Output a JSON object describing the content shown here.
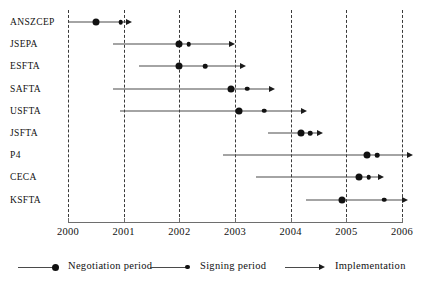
{
  "chart_data": {
    "type": "timeline",
    "title": "",
    "xlabel": "",
    "ylabel": "",
    "xlim": [
      2000,
      2006
    ],
    "xticks": [
      2000,
      2001,
      2002,
      2003,
      2004,
      2005,
      2006
    ],
    "xtick_labels": [
      "2000",
      "2001",
      "2002",
      "2003",
      "2004",
      "2005",
      "2006"
    ],
    "grid": "vertical dashed gridlines at each year tick",
    "legend_position": "below axis, horizontal",
    "categories": [
      "ANSZCEP",
      "JSEPA",
      "ESFTA",
      "SAFTA",
      "USFTA",
      "JSFTA",
      "P4",
      "CECA",
      "KSFTA"
    ],
    "series": [
      {
        "name": "ANSZCEP",
        "negotiation_start": 2000.0,
        "negotiation_end": 2000.5,
        "signing": 2000.95,
        "implementation_end": 2001.15
      },
      {
        "name": "JSEPA",
        "negotiation_start": 2000.8,
        "negotiation_end": 2002.0,
        "signing": 2002.17,
        "implementation_end": 2003.0
      },
      {
        "name": "ESFTA",
        "negotiation_start": 2001.27,
        "negotiation_end": 2002.0,
        "signing": 2002.47,
        "implementation_end": 2003.2
      },
      {
        "name": "SAFTA",
        "negotiation_start": 2000.8,
        "negotiation_end": 2002.93,
        "signing": 2003.22,
        "implementation_end": 2003.72
      },
      {
        "name": "USFTA",
        "negotiation_start": 2000.94,
        "negotiation_end": 2003.07,
        "signing": 2003.52,
        "implementation_end": 2004.3
      },
      {
        "name": "JSFTA",
        "negotiation_start": 2003.6,
        "negotiation_end": 2004.18,
        "signing": 2004.35,
        "implementation_end": 2004.58
      },
      {
        "name": "P4",
        "negotiation_start": 2002.78,
        "negotiation_end": 2005.38,
        "signing": 2005.55,
        "implementation_end": 2006.2
      },
      {
        "name": "CECA",
        "negotiation_start": 2003.38,
        "negotiation_end": 2005.23,
        "signing": 2005.4,
        "implementation_end": 2005.68
      },
      {
        "name": "KSFTA",
        "negotiation_start": 2004.28,
        "negotiation_end": 2004.93,
        "signing": 2005.68,
        "implementation_end": 2006.1
      }
    ],
    "legend": [
      {
        "marker": "line-with-large-dot",
        "label": "Negotiation period"
      },
      {
        "marker": "line-with-small-dot",
        "label": "Signing period"
      },
      {
        "marker": "line-with-arrow",
        "label": "Implementation"
      }
    ],
    "colors": {
      "marker": "#111111",
      "line": "#4a4a4a",
      "gridline": "#3a3a3a",
      "axis": "#6e6e6e",
      "text": "#111111",
      "background": "#ffffff"
    }
  }
}
